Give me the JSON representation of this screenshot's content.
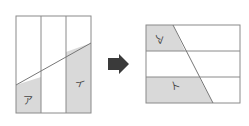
{
  "diagram": {
    "colors": {
      "line": "#8a8a8a",
      "shade": "#d9d9d9",
      "arrow": "#3a3a3a",
      "background": "#ffffff"
    },
    "left_figure": {
      "divisions": "3 vertical strips",
      "labels": {
        "a": "ア",
        "i": "イ"
      }
    },
    "arrow": {
      "direction": "right"
    },
    "right_figure": {
      "divisions": "3 horizontal strips",
      "labels": {
        "a": "ア",
        "i": "イ"
      }
    }
  }
}
